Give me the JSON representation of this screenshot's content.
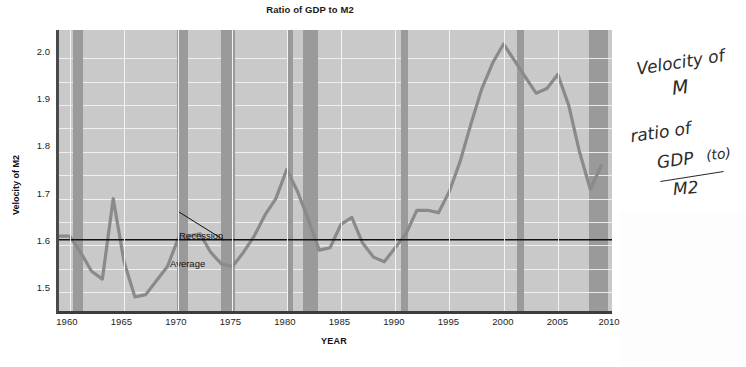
{
  "chart_data": {
    "type": "line",
    "title": "Ratio of GDP to M2",
    "xlabel": "YEAR",
    "ylabel": "Velocity of M2",
    "xlim": [
      1959,
      2010
    ],
    "ylim": [
      1.46,
      2.06
    ],
    "grid": true,
    "legend": "none",
    "xticks": [
      1960,
      1965,
      1970,
      1975,
      1980,
      1985,
      1990,
      1995,
      2000,
      2005,
      2010
    ],
    "yticks": [
      1.5,
      1.6,
      1.7,
      1.8,
      1.9,
      2.0
    ],
    "yticklabels": [
      "1.5",
      "1.6",
      "1.7",
      "1.8",
      "1.9",
      "2.0"
    ],
    "minor_y_step": 0.05,
    "series": [
      {
        "name": "Velocity of M2",
        "color": "#8a8a8a",
        "x": [
          1959,
          1960,
          1961,
          1962,
          1963,
          1964,
          1965,
          1966,
          1967,
          1968,
          1969,
          1970,
          1971,
          1972,
          1973,
          1974,
          1975,
          1976,
          1977,
          1978,
          1979,
          1980,
          1981,
          1982,
          1983,
          1984,
          1985,
          1986,
          1987,
          1988,
          1989,
          1990,
          1991,
          1992,
          1993,
          1994,
          1995,
          1996,
          1997,
          1998,
          1999,
          2000,
          2001,
          2002,
          2003,
          2004,
          2005,
          2006,
          2007,
          2008,
          2009
        ],
        "y": [
          1.62,
          1.62,
          1.585,
          1.545,
          1.528,
          1.7,
          1.565,
          1.49,
          1.495,
          1.525,
          1.555,
          1.615,
          1.62,
          1.625,
          1.585,
          1.56,
          1.555,
          1.585,
          1.62,
          1.665,
          1.7,
          1.762,
          1.715,
          1.655,
          1.59,
          1.595,
          1.645,
          1.66,
          1.605,
          1.575,
          1.565,
          1.595,
          1.625,
          1.675,
          1.675,
          1.67,
          1.715,
          1.78,
          1.86,
          1.935,
          1.99,
          2.03,
          1.995,
          1.96,
          1.925,
          1.935,
          1.965,
          1.9,
          1.8,
          1.72,
          1.77
        ]
      }
    ],
    "reference_lines": [
      {
        "name": "Average",
        "orientation": "horizontal",
        "value": 1.612,
        "color": "#111111",
        "label": "Average"
      }
    ],
    "shaded_regions": {
      "name": "Recession",
      "color": "#9a9a9a",
      "label": "Recession",
      "bands": [
        [
          1960.3,
          1961.2
        ],
        [
          1969.9,
          1970.9
        ],
        [
          1973.9,
          1975.2
        ],
        [
          1980.1,
          1980.6
        ],
        [
          1981.5,
          1982.9
        ],
        [
          1990.5,
          1991.2
        ],
        [
          2001.2,
          2001.9
        ],
        [
          2007.9,
          2009.6
        ]
      ]
    },
    "annotations": [
      {
        "name": "recession-callout",
        "text": "Recession",
        "points_to_year": 1974.2
      },
      {
        "name": "average-label",
        "text": "Average"
      }
    ]
  },
  "handwriting": {
    "line1": "Velocity of",
    "line1b": "M",
    "line2": "ratio of",
    "numerator": "GDP",
    "numerator_paren": "(to)",
    "denominator": "M2"
  },
  "colors": {
    "plot_background": "#c9c9c9",
    "recession_band": "#9a9a9a",
    "data_line": "#8a8a8a",
    "average_line": "#111111",
    "gridline": "#f4f4f4",
    "axis": "#434343",
    "text": "#1a1a1a",
    "page_background": "#ffffff"
  }
}
